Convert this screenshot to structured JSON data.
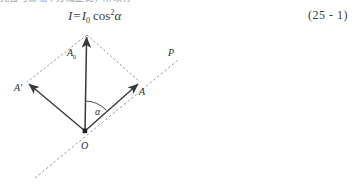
{
  "page": {
    "background_color": "#ffffff",
    "ink_color": "#2b2b2b",
    "truncated_top_line": "光强与振幅平方成正比，所以有"
  },
  "formula": {
    "lhs": "I",
    "equals": "=",
    "rhs_symbol": "I",
    "rhs_subscript": "0",
    "function": "cos",
    "exponent": "2",
    "angle": "α",
    "full_text": "I = I₀cos²α"
  },
  "equation_number": {
    "text": "(25 - 1)",
    "open": "(",
    "chapter": "25",
    "dash": "-",
    "index": "1",
    "close": ")"
  },
  "figure": {
    "caption": "",
    "labels": {
      "amplitude_original": "A",
      "amplitude_original_sub": "0",
      "component_transmitted": "A",
      "component_blocked": "A'",
      "polarizer_axis": "P",
      "origin": "O",
      "angle": "α"
    },
    "vectors": [
      {
        "name": "A0",
        "from": "O",
        "to": "apex",
        "style": "solid",
        "arrow": true
      },
      {
        "name": "A",
        "from": "O",
        "to": "right",
        "style": "solid",
        "arrow": true
      },
      {
        "name": "A-prime",
        "from": "O",
        "to": "left",
        "style": "solid",
        "arrow": true
      }
    ],
    "construction_lines": [
      {
        "name": "parallelogram-left",
        "style": "dashed"
      },
      {
        "name": "parallelogram-right",
        "style": "dashed"
      },
      {
        "name": "polarizer-axis-line",
        "style": "dashed"
      }
    ],
    "geometry": {
      "origin": [
        85,
        106
      ],
      "apex": [
        87,
        8
      ],
      "right_tip": [
        140,
        57
      ],
      "left_tip": [
        27,
        57
      ],
      "axis_start": [
        35,
        153
      ],
      "axis_end": [
        178,
        35
      ]
    },
    "colors": {
      "line": "#3a3a3a",
      "dashed": "#8a8a8a",
      "label": "#2f2f2f"
    }
  }
}
